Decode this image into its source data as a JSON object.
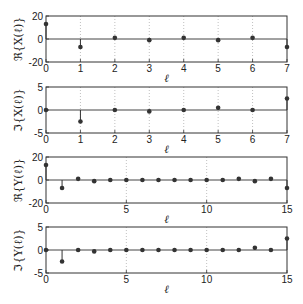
{
  "chart_data": [
    {
      "type": "stem",
      "ylabel": "ℜ{X(ℓ)}",
      "xlabel": "ℓ",
      "x": [
        0,
        1,
        2,
        3,
        4,
        5,
        6,
        7
      ],
      "values": [
        13,
        -7,
        1,
        -1,
        1,
        -1,
        1,
        -7
      ],
      "xlim": [
        0,
        7
      ],
      "ylim": [
        -20,
        20
      ],
      "xticks": [
        0,
        1,
        2,
        3,
        4,
        5,
        6,
        7
      ],
      "yticks": [
        -20,
        0,
        20
      ],
      "grid": "x-dotted",
      "box": {
        "top": 16,
        "bottom": 62
      }
    },
    {
      "type": "stem",
      "ylabel": "ℑ{X(ℓ)}",
      "xlabel": "ℓ",
      "x": [
        0,
        1,
        2,
        3,
        4,
        5,
        6,
        7
      ],
      "values": [
        0,
        -2.5,
        0,
        -0.3,
        0,
        0.5,
        0,
        2.5
      ],
      "xlim": [
        0,
        7
      ],
      "ylim": [
        -5,
        5
      ],
      "xticks": [
        0,
        1,
        2,
        3,
        4,
        5,
        6,
        7
      ],
      "yticks": [
        -5,
        0,
        5
      ],
      "grid": "x-dotted",
      "box": {
        "top": 87,
        "bottom": 133
      }
    },
    {
      "type": "stem",
      "ylabel": "ℜ{Y(ℓ)}",
      "xlabel": "ℓ",
      "x": [
        0,
        1,
        2,
        3,
        4,
        5,
        6,
        7,
        8,
        9,
        10,
        11,
        12,
        13,
        14,
        15
      ],
      "values": [
        13,
        -7,
        1,
        -1,
        0,
        0,
        0,
        0,
        0,
        0,
        0,
        0,
        1,
        -1,
        1,
        -7
      ],
      "xlim": [
        0,
        15
      ],
      "ylim": [
        -20,
        20
      ],
      "xticks": [
        0,
        5,
        10,
        15
      ],
      "yticks": [
        -20,
        0,
        20
      ],
      "grid": "x-dotted",
      "box": {
        "top": 157,
        "bottom": 203
      }
    },
    {
      "type": "stem",
      "ylabel": "ℑ{Y(ℓ)}",
      "xlabel": "ℓ",
      "x": [
        0,
        1,
        2,
        3,
        4,
        5,
        6,
        7,
        8,
        9,
        10,
        11,
        12,
        13,
        14,
        15
      ],
      "values": [
        0,
        -2.5,
        0,
        -0.3,
        0,
        0,
        0,
        0,
        0,
        0,
        0,
        0,
        0,
        0.5,
        0,
        2.5
      ],
      "xlim": [
        0,
        15
      ],
      "ylim": [
        -5,
        5
      ],
      "xticks": [
        0,
        5,
        10,
        15
      ],
      "yticks": [
        -5,
        0,
        5
      ],
      "grid": "x-dotted",
      "box": {
        "top": 227,
        "bottom": 273
      }
    }
  ],
  "colors": {
    "axis": "#333333",
    "grid": "#b0b0b0",
    "marker": "#333333",
    "zero_line": "#444444"
  }
}
